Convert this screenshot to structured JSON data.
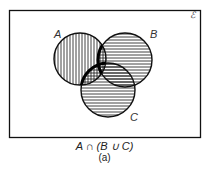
{
  "diagram": {
    "type": "venn",
    "universe_label": "ℰ",
    "sets": [
      {
        "label": "A",
        "cx": 80,
        "cy": 59,
        "r": 26,
        "hatch": "vertical"
      },
      {
        "label": "B",
        "cx": 125,
        "cy": 60,
        "r": 27,
        "hatch": "horizontal"
      },
      {
        "label": "C",
        "cx": 108,
        "cy": 90,
        "r": 27,
        "hatch": "horizontal"
      }
    ],
    "highlighted_region": "A ∩ (B ∪ C)",
    "caption": "A ∩ (B ∪ C)",
    "subcaption": "(a)"
  }
}
